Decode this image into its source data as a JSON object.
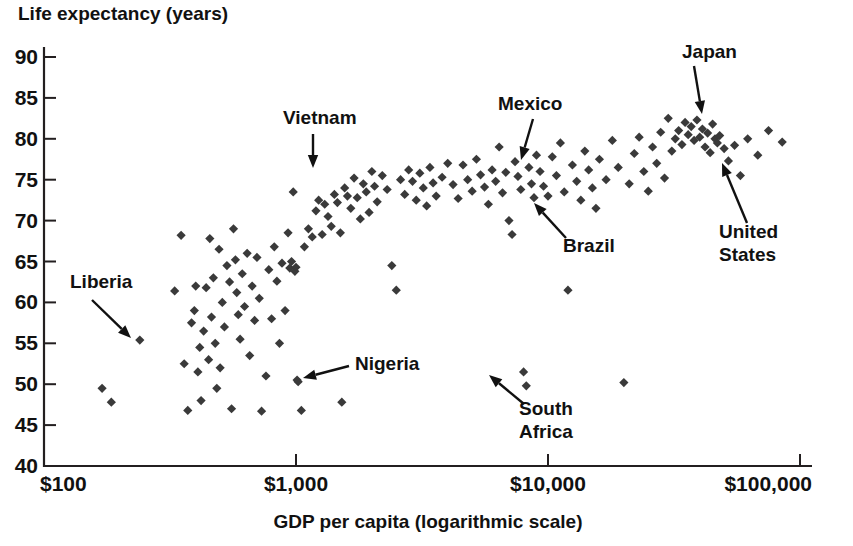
{
  "chart_data": {
    "type": "scatter",
    "title": "",
    "ylabel": "Life expectancy (years)",
    "xlabel": "GDP per capita (logarithmic scale)",
    "x_scale": "log",
    "xlim": [
      100,
      100000
    ],
    "ylim": [
      40,
      90
    ],
    "grid": false,
    "legend": "none",
    "y_ticks": [
      "90",
      "85",
      "80",
      "75",
      "70",
      "65",
      "60",
      "55",
      "50",
      "45",
      "40"
    ],
    "y_tick_values": [
      90,
      85,
      80,
      75,
      70,
      65,
      60,
      55,
      50,
      45,
      40
    ],
    "x_ticks": [
      "$100",
      "$1,000",
      "$10,000",
      "$100,000"
    ],
    "x_tick_values": [
      100,
      1000,
      10000,
      100000
    ],
    "marker": "diamond",
    "marker_color": "#3a3a3a",
    "annotations": [
      {
        "label": "Liberia",
        "text_x": 70,
        "text_y": 288,
        "tip_x": 131,
        "tip_y": 338,
        "from_x": 92,
        "from_y": 300
      },
      {
        "label": "Vietnam",
        "text_x": 283,
        "text_y": 124,
        "tip_x": 313,
        "tip_y": 168,
        "from_x": 313,
        "from_y": 134
      },
      {
        "label": "Nigeria",
        "text_x": 355,
        "text_y": 370,
        "tip_x": 303,
        "tip_y": 378,
        "from_x": 349,
        "from_y": 366
      },
      {
        "label": "Mexico",
        "text_x": 498,
        "text_y": 110,
        "tip_x": 521,
        "tip_y": 160,
        "from_x": 533,
        "from_y": 119
      },
      {
        "label": "Brazil",
        "text_x": 563,
        "text_y": 252,
        "tip_x": 534,
        "tip_y": 203,
        "from_x": 566,
        "from_y": 238
      },
      {
        "label": "South Africa",
        "text_x": 519,
        "text_y": 415,
        "tip_x": 489,
        "tip_y": 375,
        "from_x": 524,
        "from_y": 404
      },
      {
        "label": "Japan",
        "text_x": 682,
        "text_y": 58,
        "tip_x": 702,
        "tip_y": 114,
        "from_x": 694,
        "from_y": 66
      },
      {
        "label": "United States",
        "text_x": 719,
        "text_y": 238,
        "tip_x": 722,
        "tip_y": 163,
        "from_x": 747,
        "from_y": 223
      }
    ],
    "points": [
      [
        170,
        49.5
      ],
      [
        185,
        47.8
      ],
      [
        240,
        55.4
      ],
      [
        330,
        61.4
      ],
      [
        350,
        68.2
      ],
      [
        360,
        52.5
      ],
      [
        372,
        46.8
      ],
      [
        385,
        57.5
      ],
      [
        395,
        59.0
      ],
      [
        400,
        62.0
      ],
      [
        408,
        51.5
      ],
      [
        415,
        54.5
      ],
      [
        420,
        48.0
      ],
      [
        430,
        56.5
      ],
      [
        440,
        61.8
      ],
      [
        450,
        53.0
      ],
      [
        455,
        67.8
      ],
      [
        462,
        58.2
      ],
      [
        470,
        63.0
      ],
      [
        478,
        55.0
      ],
      [
        485,
        49.5
      ],
      [
        495,
        66.5
      ],
      [
        500,
        52.0
      ],
      [
        510,
        60.0
      ],
      [
        520,
        57.0
      ],
      [
        532,
        64.5
      ],
      [
        545,
        62.5
      ],
      [
        555,
        47.0
      ],
      [
        565,
        69.0
      ],
      [
        575,
        65.2
      ],
      [
        582,
        61.2
      ],
      [
        590,
        58.5
      ],
      [
        600,
        55.5
      ],
      [
        612,
        63.5
      ],
      [
        625,
        59.5
      ],
      [
        640,
        66.0
      ],
      [
        655,
        53.5
      ],
      [
        670,
        62.0
      ],
      [
        685,
        57.8
      ],
      [
        700,
        65.5
      ],
      [
        715,
        60.5
      ],
      [
        730,
        46.7
      ],
      [
        760,
        51.0
      ],
      [
        780,
        64.0
      ],
      [
        800,
        58.0
      ],
      [
        820,
        66.8
      ],
      [
        840,
        62.6
      ],
      [
        860,
        55.0
      ],
      [
        880,
        64.8
      ],
      [
        905,
        59.0
      ],
      [
        930,
        68.5
      ],
      [
        945,
        64.2
      ],
      [
        960,
        65.0
      ],
      [
        975,
        73.5
      ],
      [
        990,
        63.8
      ],
      [
        1000,
        64.3
      ],
      [
        1010,
        50.5
      ],
      [
        1020,
        50.3
      ],
      [
        1050,
        46.8
      ],
      [
        1080,
        66.8
      ],
      [
        1120,
        69.0
      ],
      [
        1160,
        68.0
      ],
      [
        1200,
        71.2
      ],
      [
        1230,
        72.5
      ],
      [
        1270,
        68.3
      ],
      [
        1300,
        72.0
      ],
      [
        1340,
        70.5
      ],
      [
        1380,
        69.3
      ],
      [
        1420,
        73.2
      ],
      [
        1460,
        72.2
      ],
      [
        1500,
        68.5
      ],
      [
        1520,
        47.8
      ],
      [
        1560,
        74.0
      ],
      [
        1600,
        73.0
      ],
      [
        1650,
        71.5
      ],
      [
        1700,
        75.2
      ],
      [
        1750,
        72.8
      ],
      [
        1800,
        70.2
      ],
      [
        1850,
        74.5
      ],
      [
        1900,
        73.5
      ],
      [
        1950,
        71.0
      ],
      [
        2000,
        76.0
      ],
      [
        2050,
        74.2
      ],
      [
        2100,
        72.3
      ],
      [
        2200,
        75.5
      ],
      [
        2300,
        73.8
      ],
      [
        2400,
        64.5
      ],
      [
        2500,
        61.5
      ],
      [
        2600,
        75.0
      ],
      [
        2700,
        73.2
      ],
      [
        2800,
        76.2
      ],
      [
        2900,
        74.8
      ],
      [
        3000,
        72.5
      ],
      [
        3100,
        75.8
      ],
      [
        3200,
        74.0
      ],
      [
        3300,
        71.8
      ],
      [
        3400,
        76.5
      ],
      [
        3500,
        74.6
      ],
      [
        3600,
        73.0
      ],
      [
        3800,
        75.3
      ],
      [
        4000,
        77.0
      ],
      [
        4200,
        74.4
      ],
      [
        4400,
        72.7
      ],
      [
        4600,
        76.8
      ],
      [
        4800,
        75.0
      ],
      [
        5000,
        73.6
      ],
      [
        5200,
        77.5
      ],
      [
        5400,
        75.6
      ],
      [
        5600,
        74.1
      ],
      [
        5800,
        72.0
      ],
      [
        6000,
        76.2
      ],
      [
        6200,
        74.8
      ],
      [
        6400,
        79.0
      ],
      [
        6600,
        73.4
      ],
      [
        6800,
        75.9
      ],
      [
        7000,
        70.0
      ],
      [
        7200,
        68.3
      ],
      [
        7400,
        77.2
      ],
      [
        7600,
        75.4
      ],
      [
        7800,
        73.8
      ],
      [
        8000,
        51.5
      ],
      [
        8200,
        49.8
      ],
      [
        8400,
        76.5
      ],
      [
        8600,
        74.5
      ],
      [
        8800,
        72.8
      ],
      [
        9000,
        78.0
      ],
      [
        9300,
        76.0
      ],
      [
        9600,
        74.2
      ],
      [
        10000,
        73.0
      ],
      [
        10400,
        77.8
      ],
      [
        10800,
        75.5
      ],
      [
        11200,
        79.5
      ],
      [
        11600,
        73.5
      ],
      [
        12000,
        61.5
      ],
      [
        12500,
        76.8
      ],
      [
        13000,
        74.8
      ],
      [
        13500,
        72.5
      ],
      [
        14000,
        78.5
      ],
      [
        14500,
        76.2
      ],
      [
        15000,
        74.0
      ],
      [
        15500,
        71.5
      ],
      [
        16000,
        77.5
      ],
      [
        17000,
        75.0
      ],
      [
        18000,
        79.8
      ],
      [
        19000,
        76.5
      ],
      [
        20000,
        50.2
      ],
      [
        21000,
        74.5
      ],
      [
        22000,
        78.2
      ],
      [
        23000,
        80.2
      ],
      [
        24000,
        76.0
      ],
      [
        25000,
        73.6
      ],
      [
        26000,
        79.0
      ],
      [
        27000,
        77.0
      ],
      [
        28000,
        80.8
      ],
      [
        29000,
        75.2
      ],
      [
        30000,
        82.5
      ],
      [
        31000,
        78.5
      ],
      [
        32000,
        80.0
      ],
      [
        33000,
        81.0
      ],
      [
        34000,
        79.3
      ],
      [
        35000,
        82.0
      ],
      [
        36000,
        80.5
      ],
      [
        37000,
        81.5
      ],
      [
        38000,
        79.8
      ],
      [
        39000,
        82.3
      ],
      [
        40000,
        80.2
      ],
      [
        41000,
        81.2
      ],
      [
        42000,
        79.0
      ],
      [
        43000,
        80.7
      ],
      [
        44000,
        78.3
      ],
      [
        45000,
        81.8
      ],
      [
        46000,
        80.0
      ],
      [
        47000,
        79.5
      ],
      [
        48000,
        80.4
      ],
      [
        50000,
        78.8
      ],
      [
        52000,
        77.3
      ],
      [
        55000,
        79.2
      ],
      [
        58000,
        75.5
      ],
      [
        62000,
        80.0
      ],
      [
        68000,
        78.0
      ],
      [
        75000,
        81.0
      ],
      [
        85000,
        79.6
      ]
    ]
  }
}
